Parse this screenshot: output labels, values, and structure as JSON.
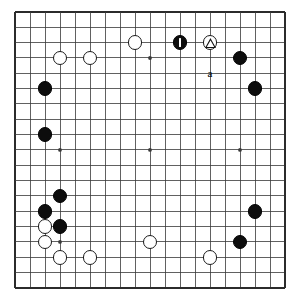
{
  "diagram": {
    "kind": "go-board-diagram",
    "board_size": 19,
    "grid": {
      "origin_x": 15,
      "origin_y": 12,
      "spacing_x": 15.0,
      "spacing_y": 15.33,
      "line_color": "#3a3a3a",
      "border_color": "#2b2b2b",
      "background_color": "#ffffff"
    },
    "star_points": [
      {
        "col": 3,
        "row": 3
      },
      {
        "col": 9,
        "row": 3
      },
      {
        "col": 15,
        "row": 3
      },
      {
        "col": 3,
        "row": 9
      },
      {
        "col": 9,
        "row": 9
      },
      {
        "col": 15,
        "row": 9
      },
      {
        "col": 3,
        "row": 15
      },
      {
        "col": 9,
        "row": 15
      },
      {
        "col": 15,
        "row": 15
      }
    ],
    "stone_colors": {
      "black": "#0d0d0d",
      "white": "#ffffff",
      "outline": "#1a1a1a"
    },
    "stones": [
      {
        "col": 8,
        "row": 2,
        "color": "white",
        "marker": "none"
      },
      {
        "col": 11,
        "row": 2,
        "color": "black",
        "marker": "move"
      },
      {
        "col": 13,
        "row": 2,
        "color": "white",
        "marker": "triangle"
      },
      {
        "col": 3,
        "row": 3,
        "color": "white",
        "marker": "none"
      },
      {
        "col": 5,
        "row": 3,
        "color": "white",
        "marker": "none"
      },
      {
        "col": 15,
        "row": 3,
        "color": "black",
        "marker": "none"
      },
      {
        "col": 2,
        "row": 5,
        "color": "black",
        "marker": "none"
      },
      {
        "col": 16,
        "row": 5,
        "color": "black",
        "marker": "none"
      },
      {
        "col": 2,
        "row": 8,
        "color": "black",
        "marker": "none"
      },
      {
        "col": 3,
        "row": 12,
        "color": "black",
        "marker": "none"
      },
      {
        "col": 2,
        "row": 13,
        "color": "black",
        "marker": "none"
      },
      {
        "col": 16,
        "row": 13,
        "color": "black",
        "marker": "none"
      },
      {
        "col": 2,
        "row": 14,
        "color": "white",
        "marker": "none"
      },
      {
        "col": 3,
        "row": 14,
        "color": "black",
        "marker": "none"
      },
      {
        "col": 2,
        "row": 15,
        "color": "white",
        "marker": "none"
      },
      {
        "col": 9,
        "row": 15,
        "color": "white",
        "marker": "none"
      },
      {
        "col": 15,
        "row": 15,
        "color": "black",
        "marker": "none"
      },
      {
        "col": 3,
        "row": 16,
        "color": "white",
        "marker": "none"
      },
      {
        "col": 5,
        "row": 16,
        "color": "white",
        "marker": "none"
      },
      {
        "col": 13,
        "row": 16,
        "color": "white",
        "marker": "none"
      }
    ],
    "labels": [
      {
        "text": "a",
        "col": 13,
        "row": 4
      }
    ]
  }
}
